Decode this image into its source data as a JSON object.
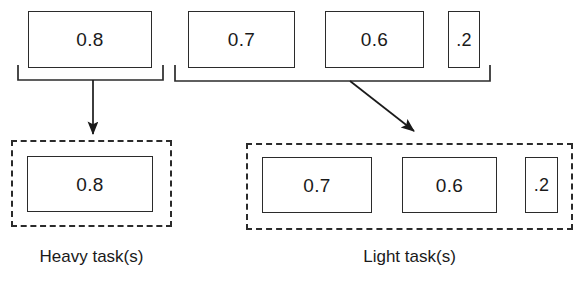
{
  "diagram": {
    "background_color": "#ffffff",
    "stroke_color": "#2b2b2b",
    "text_color": "#1a1a1a"
  },
  "top_row": {
    "heavy_group": {
      "boxes": [
        {
          "value": "0.8",
          "x": 28,
          "y": 11,
          "w": 124,
          "h": 57
        }
      ],
      "bracket": {
        "x1": 18,
        "x2": 163,
        "y_top": 65,
        "y_bar": 80
      }
    },
    "light_group": {
      "boxes": [
        {
          "value": "0.7",
          "x": 188,
          "y": 11,
          "w": 107,
          "h": 57
        },
        {
          "value": "0.6",
          "x": 325,
          "y": 11,
          "w": 99,
          "h": 57
        },
        {
          "value": ".2",
          "x": 448,
          "y": 11,
          "w": 32,
          "h": 57
        }
      ],
      "bracket": {
        "x1": 175,
        "x2": 490,
        "y_top": 65,
        "y_bar": 81
      }
    }
  },
  "arrows": [
    {
      "name": "heavy-arrow",
      "x1": 93,
      "y1": 80,
      "x2": 93,
      "y2": 134
    },
    {
      "name": "light-arrow",
      "x1": 350,
      "y1": 81,
      "x2": 414,
      "y2": 131
    }
  ],
  "bottom_row": {
    "heavy_partition": {
      "label": "Heavy task(s)",
      "container": {
        "x": 11,
        "y": 140,
        "w": 161,
        "h": 87
      },
      "boxes": [
        {
          "value": "0.8",
          "x": 27,
          "y": 156,
          "w": 126,
          "h": 56
        }
      ],
      "label_pos": {
        "x": 11,
        "y": 248,
        "w": 161
      }
    },
    "light_partition": {
      "label": "Light task(s)",
      "container": {
        "x": 246,
        "y": 143,
        "w": 327,
        "h": 87
      },
      "boxes": [
        {
          "value": "0.7",
          "x": 262,
          "y": 157,
          "w": 110,
          "h": 56
        },
        {
          "value": "0.6",
          "x": 402,
          "y": 157,
          "w": 95,
          "h": 56
        },
        {
          "value": ".2",
          "x": 525,
          "y": 157,
          "w": 33,
          "h": 56
        }
      ],
      "label_pos": {
        "x": 246,
        "y": 248,
        "w": 327
      }
    }
  }
}
